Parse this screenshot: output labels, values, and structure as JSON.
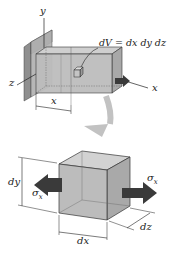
{
  "diagram": {
    "top_figure": {
      "axis_labels": {
        "y": "y",
        "z": "z",
        "x": "x"
      },
      "element_label": "dV = dx dy dz",
      "distance_label": "x"
    },
    "bottom_figure": {
      "dim_labels": {
        "dy": "dy",
        "dx": "dx",
        "dz": "dz"
      },
      "stress_left": "σ",
      "stress_left_sub": "x",
      "stress_right": "σ",
      "stress_right_sub": "x"
    },
    "colors": {
      "box_fill": "#b8b8b8",
      "box_edge": "#333333",
      "wall": "#9a9a9a",
      "arrow_dark": "#3a3a3a",
      "curved_arrow": "#bdbdbd"
    }
  }
}
